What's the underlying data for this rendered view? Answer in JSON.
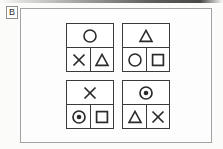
{
  "figure": {
    "panel_letter": "B",
    "frame_color": "#a2a2a2",
    "ink_color": "#3a3a3a",
    "background_color": "#fdfdfd",
    "artifact": {
      "name": "top-edge-scan-line",
      "color": "#3a3a3a"
    }
  },
  "panels": [
    {
      "name": "panel-top-left",
      "position": "top-left",
      "top_cell": {
        "icon": "circle-icon",
        "label": "circle"
      },
      "bottom_cells": [
        {
          "icon": "x-icon",
          "label": "x"
        },
        {
          "icon": "triangle-icon",
          "label": "triangle"
        }
      ]
    },
    {
      "name": "panel-top-right",
      "position": "top-right",
      "top_cell": {
        "icon": "triangle-icon",
        "label": "triangle"
      },
      "bottom_cells": [
        {
          "icon": "circle-icon",
          "label": "circle"
        },
        {
          "icon": "square-icon",
          "label": "square"
        }
      ]
    },
    {
      "name": "panel-bottom-left",
      "position": "bottom-left",
      "top_cell": {
        "icon": "x-icon",
        "label": "x"
      },
      "bottom_cells": [
        {
          "icon": "concentric-circle-icon",
          "label": "concentric circle"
        },
        {
          "icon": "square-icon",
          "label": "square"
        }
      ]
    },
    {
      "name": "panel-bottom-right",
      "position": "bottom-right",
      "top_cell": {
        "icon": "concentric-circle-icon",
        "label": "concentric circle"
      },
      "bottom_cells": [
        {
          "icon": "triangle-icon",
          "label": "triangle"
        },
        {
          "icon": "x-icon",
          "label": "x"
        }
      ]
    }
  ]
}
